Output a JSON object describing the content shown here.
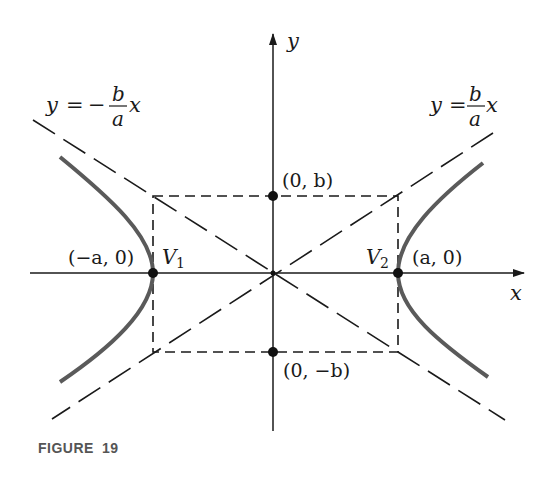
{
  "figure": {
    "caption_label": "FIGURE",
    "caption_number": "19",
    "colors": {
      "axis": "#1a1a1a",
      "dashed": "#1a1a1a",
      "hyperbola": "#5a5a5a",
      "caption": "#555555"
    }
  },
  "axes": {
    "x_label": "x",
    "y_label": "y"
  },
  "asymptotes": {
    "negative": {
      "lhs": "y",
      "eq": "=",
      "sign": "−",
      "num": "b",
      "den": "a",
      "var": "x"
    },
    "positive": {
      "lhs": "y",
      "eq": "=",
      "num": "b",
      "den": "a",
      "var": "x"
    }
  },
  "points": {
    "v1_coord": "(−a, 0)",
    "v1_label": "V",
    "v1_sub": "1",
    "v2_coord": "(a, 0)",
    "v2_label": "V",
    "v2_sub": "2",
    "b_top": "(0, b)",
    "b_bottom": "(0, −b)"
  }
}
